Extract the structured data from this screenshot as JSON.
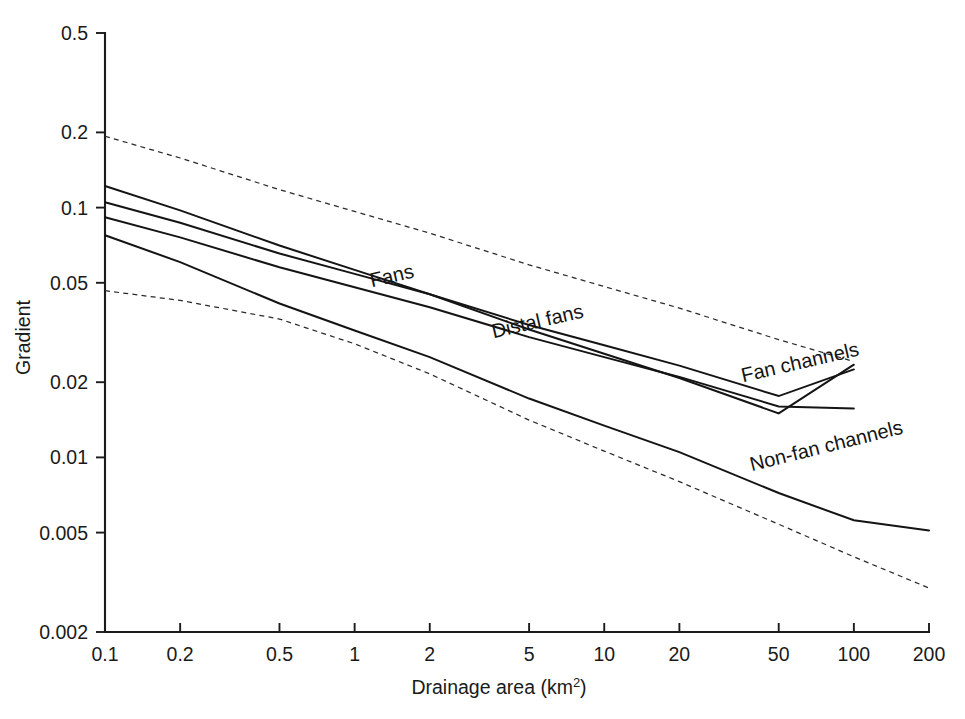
{
  "figure": {
    "background": "#ffffff",
    "ink_color": "#141414",
    "width": 965,
    "height": 719
  },
  "chart_data": {
    "type": "line",
    "title": "",
    "xlabel": "Drainage area (km2)",
    "xlabel_base": "Drainage area (km",
    "xlabel_sup": "2",
    "xlabel_tail": ")",
    "ylabel": "Gradient",
    "xscale": "log",
    "yscale": "log",
    "xlim": [
      0.1,
      200
    ],
    "ylim": [
      0.002,
      0.5
    ],
    "grid": false,
    "legend": "inline-labels",
    "xticks": [
      0.1,
      0.2,
      0.5,
      1,
      2,
      5,
      10,
      20,
      50,
      100,
      200
    ],
    "xticklabels": [
      "0.1",
      "0.2",
      "0.5",
      "1",
      "2",
      "5",
      "10",
      "20",
      "50",
      "100",
      "200"
    ],
    "yticks": [
      0.002,
      0.005,
      0.01,
      0.02,
      0.05,
      0.1,
      0.2,
      0.5
    ],
    "yticklabels": [
      "0.002",
      "0.005",
      "0.01",
      "0.02",
      "0.05",
      "0.1",
      "0.2",
      "0.5"
    ],
    "series": [
      {
        "name": "Upper envelope",
        "label": "",
        "style": "dashed",
        "x": [
          0.1,
          0.2,
          0.5,
          1,
          2,
          5,
          10,
          20,
          50,
          100
        ],
        "y": [
          0.193,
          0.158,
          0.118,
          0.0965,
          0.079,
          0.059,
          0.0483,
          0.0396,
          0.0296,
          0.0242
        ]
      },
      {
        "name": "Fans",
        "label": "Fans",
        "style": "solid",
        "x": [
          0.1,
          0.2,
          0.5,
          1,
          2,
          5,
          10,
          20,
          50,
          100
        ],
        "y": [
          0.122,
          0.0975,
          0.0705,
          0.0563,
          0.045,
          0.0325,
          0.026,
          0.0208,
          0.015,
          0.0235
        ]
      },
      {
        "name": "Distal fans",
        "label": "Distal fans",
        "style": "solid",
        "x": [
          0.1,
          0.2,
          0.5,
          1,
          2,
          5,
          10,
          20,
          50,
          100
        ],
        "y": [
          0.105,
          0.087,
          0.0655,
          0.0543,
          0.045,
          0.0339,
          0.0281,
          0.0233,
          0.0176,
          0.0225
        ]
      },
      {
        "name": "Fan channels",
        "label": "Fan channels",
        "style": "solid",
        "x": [
          0.1,
          0.2,
          0.5,
          1,
          2,
          5,
          10,
          20,
          50,
          100
        ],
        "y": [
          0.0915,
          0.076,
          0.0577,
          0.048,
          0.0399,
          0.0303,
          0.0252,
          0.021,
          0.016,
          0.0157
        ]
      },
      {
        "name": "Non-fan channels",
        "label": "Non-fan channels",
        "style": "solid",
        "x": [
          0.1,
          0.2,
          0.5,
          1,
          2,
          5,
          10,
          20,
          50,
          100,
          200
        ],
        "y": [
          0.0775,
          0.0605,
          0.0413,
          0.0322,
          0.0252,
          0.0172,
          0.0134,
          0.0105,
          0.0072,
          0.0056,
          0.0051
        ]
      },
      {
        "name": "Lower envelope",
        "label": "",
        "style": "dashed",
        "x": [
          0.1,
          0.2,
          0.5,
          1,
          2,
          5,
          10,
          20,
          50,
          100,
          200
        ],
        "y": [
          0.0465,
          0.0425,
          0.0358,
          0.0285,
          0.0216,
          0.0141,
          0.0106,
          0.008,
          0.0054,
          0.004,
          0.003
        ]
      }
    ],
    "annotations": [
      {
        "text": "Fans",
        "x": 1.17,
        "y": 0.048,
        "rotation": -13
      },
      {
        "text": "Distal fans",
        "x": 3.6,
        "y": 0.03,
        "rotation": -13
      },
      {
        "text": "Fan channels",
        "x": 36,
        "y": 0.02,
        "rotation": -13
      },
      {
        "text": "Non-fan channels",
        "x": 39,
        "y": 0.0088,
        "rotation": -14
      }
    ]
  }
}
